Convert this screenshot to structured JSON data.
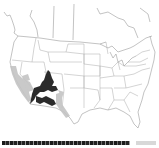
{
  "map": {
    "title": "Species range map — North America",
    "region": "North America (USA, southern Canada, northern Mexico)",
    "projection": "Albers conic (approx.)",
    "colors": {
      "background": "#ffffff",
      "boundary": "#9a9a9a",
      "core_range": "#2b2b2b",
      "peripheral_range": "#c4c4c4"
    },
    "range_layers": [
      {
        "name": "core-range",
        "description": "Dark range: Arizona, southern Utah, western New Mexico, northern Sonora",
        "color": "#2b2b2b"
      },
      {
        "name": "peripheral-range",
        "description": "Light range: California coast & deserts, southern Nevada, eastern New Mexico, west Texas",
        "color": "#c4c4c4"
      }
    ]
  },
  "legend": {
    "strip_text": "",
    "note": "Bottom legend strip is illegible at this resolution"
  }
}
